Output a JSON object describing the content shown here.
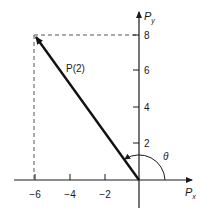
{
  "diagram": {
    "type": "vector-plot",
    "colors": {
      "axes": "#1a1a1a",
      "vector": "#111111",
      "dashed": "#555555",
      "background": "#ffffff"
    },
    "axes": {
      "x_label_main": "P",
      "x_label_sub": "x",
      "y_label_main": "P",
      "y_label_sub": "y",
      "x_ticks": [
        {
          "value": -6,
          "label": "−6"
        },
        {
          "value": -4,
          "label": "−4"
        },
        {
          "value": -2,
          "label": "−2"
        }
      ],
      "y_ticks": [
        {
          "value": 2,
          "label": "2"
        },
        {
          "value": 4,
          "label": "4"
        },
        {
          "value": 6,
          "label": "6"
        },
        {
          "value": 8,
          "label": "8"
        }
      ]
    },
    "vector": {
      "label": "P(2)",
      "from": [
        0,
        0
      ],
      "to": [
        -6,
        8
      ]
    },
    "angle": {
      "label": "θ",
      "description": "angle measured from positive x-axis to vector"
    },
    "projections": {
      "x_component": -6,
      "y_component": 8,
      "style": "dashed"
    }
  }
}
